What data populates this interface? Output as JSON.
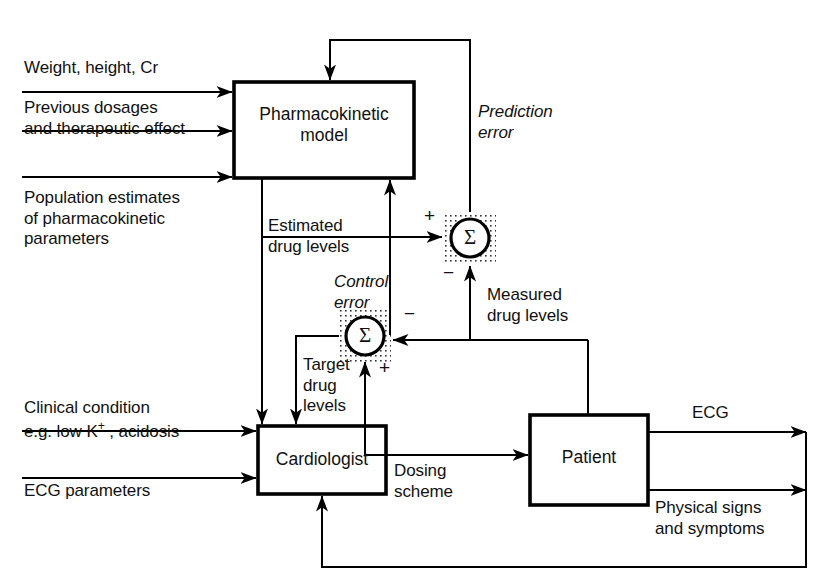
{
  "diagram": {
    "colors": {
      "line": "#000000",
      "text": "#111111",
      "background": "#ffffff",
      "dotted_shade": "#333333"
    },
    "blocks": [
      {
        "id": "pharmacokinetic-model",
        "label_line1": "Pharmacokinetic",
        "label_line2": "model"
      },
      {
        "id": "cardiologist",
        "label_line1": "Cardiologist",
        "label_line2": ""
      },
      {
        "id": "patient",
        "label_line1": "Patient",
        "label_line2": ""
      }
    ],
    "summing_junctions": [
      {
        "id": "prediction-error-sum",
        "symbol": "Σ",
        "inputs": [
          "+",
          "−"
        ]
      },
      {
        "id": "control-error-sum",
        "symbol": "Σ",
        "inputs": [
          "+",
          "−"
        ]
      }
    ],
    "inputs": [
      {
        "id": "weight-height-cr",
        "line1": "Weight, height, Cr",
        "line2": ""
      },
      {
        "id": "previous-dosages",
        "line1": "Previous dosages",
        "line2": "and therapeutic effect"
      },
      {
        "id": "population-estimates",
        "line1": "Population estimates",
        "line2": "of pharmacokinetic",
        "line3": "parameters"
      },
      {
        "id": "clinical-condition",
        "line1": "Clinical condition",
        "line2_pre": "e.g. low K",
        "line2_sup": "+",
        "line2_post": " , acidosis"
      },
      {
        "id": "ecg-parameters",
        "line1": "ECG parameters",
        "line2": ""
      }
    ],
    "signals": [
      {
        "id": "prediction-error",
        "line1": "Prediction",
        "line2": "error",
        "style": "italic"
      },
      {
        "id": "estimated-drug-levels",
        "line1": "Estimated",
        "line2": "drug levels",
        "style": "normal"
      },
      {
        "id": "control-error",
        "line1": "Control",
        "line2": "error",
        "style": "italic"
      },
      {
        "id": "measured-drug-levels",
        "line1": "Measured",
        "line2": "drug levels",
        "style": "normal"
      },
      {
        "id": "target-drug-levels",
        "line1": "Target",
        "line2": "drug",
        "line3": "levels",
        "style": "normal"
      },
      {
        "id": "dosing-scheme",
        "line1": "Dosing",
        "line2": "scheme",
        "style": "normal"
      },
      {
        "id": "ecg-output",
        "line1": "ECG",
        "line2": "",
        "style": "normal"
      },
      {
        "id": "physical-signs",
        "line1": "Physical signs",
        "line2": "and symptoms",
        "style": "normal"
      }
    ],
    "sign_markers": [
      {
        "id": "plus-prediction",
        "text": "+"
      },
      {
        "id": "minus-prediction",
        "text": "−"
      },
      {
        "id": "minus-control",
        "text": "−"
      },
      {
        "id": "plus-control",
        "text": "+"
      }
    ],
    "sigma_symbol": "Σ"
  }
}
